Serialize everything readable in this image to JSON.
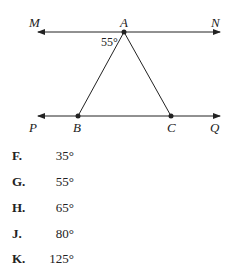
{
  "figure": {
    "points": {
      "M": "M",
      "A": "A",
      "N": "N",
      "P": "P",
      "B": "B",
      "C": "C",
      "Q": "Q"
    },
    "angle_label": "55°"
  },
  "choices": [
    {
      "letter": "F.",
      "value": "35°"
    },
    {
      "letter": "G.",
      "value": "55°"
    },
    {
      "letter": "H.",
      "value": "65°"
    },
    {
      "letter": "J.",
      "value": "80°"
    },
    {
      "letter": "K.",
      "value": "125°"
    }
  ]
}
